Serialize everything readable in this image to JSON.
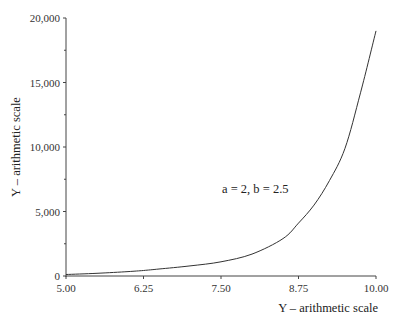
{
  "chart_data": {
    "type": "line",
    "title": "",
    "xlabel": "Y – arithmetic scale",
    "ylabel": "Y – arithmetic scale",
    "xlim": [
      5.0,
      10.0
    ],
    "ylim": [
      0,
      20000
    ],
    "x_ticks": [
      "5.00",
      "6.25",
      "7.50",
      "8.75",
      "10.00"
    ],
    "y_ticks": [
      "0",
      "5,000",
      "10,000",
      "15,000",
      "20,000"
    ],
    "y_minor_ticks": [
      2500,
      7500,
      12500,
      17500
    ],
    "grid": false,
    "legend": null,
    "annotations": [
      {
        "text": "a = 2, b = 2.5",
        "x": 8.6,
        "y": 6800
      }
    ],
    "series": [
      {
        "name": "a = 2, b = 2.5",
        "color": "#333333",
        "x": [
          5.0,
          5.5,
          6.0,
          6.25,
          6.5,
          7.0,
          7.5,
          8.0,
          8.5,
          8.75,
          9.0,
          9.25,
          9.5,
          9.75,
          10.0
        ],
        "y": [
          120,
          210,
          340,
          430,
          540,
          780,
          1100,
          1700,
          2900,
          4100,
          5500,
          7400,
          9900,
          14200,
          19000
        ]
      }
    ]
  }
}
